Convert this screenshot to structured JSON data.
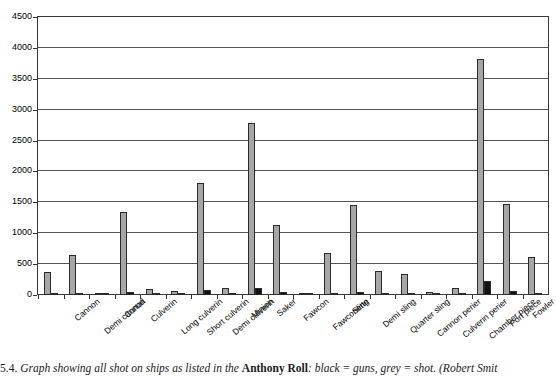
{
  "figure": {
    "caption_prefix": "5.4.",
    "caption_part1": " Graph showing all shot on ships as listed in the ",
    "caption_bold": "Anthony Roll",
    "caption_part2": ": black = guns, grey = shot. (Robert Smit"
  },
  "chart_data": {
    "type": "bar",
    "title": "",
    "xlabel": "",
    "ylabel": "",
    "ylim": [
      0,
      4500
    ],
    "ytick_step": 500,
    "grid": true,
    "legend": "black = guns, grey = shot",
    "yticks": [
      "0",
      "500",
      "1000",
      "1500",
      "2000",
      "2500",
      "3000",
      "3500",
      "4000",
      "4500"
    ],
    "categories": [
      "Cannon",
      "Demi cannon",
      "Curtall",
      "Culverin",
      "Long culverin",
      "Short culverin",
      "Demi culverin",
      "Minion",
      "Saker",
      "Fawcon",
      "Fawconette",
      "Sling",
      "Demi sling",
      "Quarter sling",
      "Cannon perier",
      "Culverin perier",
      "Chamber piece",
      "Port piece",
      "Fowler",
      "Top piece"
    ],
    "series": [
      {
        "name": "shot",
        "color": "#a6a6a6",
        "values": [
          370,
          650,
          20,
          1340,
          90,
          60,
          1820,
          110,
          2780,
          1130,
          30,
          680,
          1460,
          390,
          340,
          50,
          110,
          3820,
          1480,
          610
        ]
      },
      {
        "name": "guns",
        "color": "#111111",
        "values": [
          15,
          40,
          5,
          45,
          5,
          5,
          80,
          10,
          110,
          55,
          10,
          20,
          55,
          30,
          20,
          10,
          20,
          230,
          60,
          30
        ]
      }
    ]
  }
}
